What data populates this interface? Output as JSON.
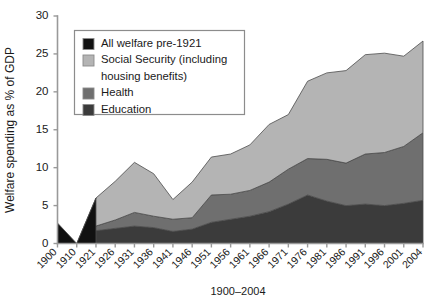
{
  "chart_data": {
    "type": "area",
    "stacked": true,
    "title": "",
    "xlabel": "1900–2004",
    "ylabel": "Welfare spending as % of GDP",
    "ylim": [
      0,
      30
    ],
    "yticks": [
      0,
      5,
      10,
      15,
      20,
      25,
      30
    ],
    "grid": false,
    "legend_position": "top-left",
    "categories": [
      "1900",
      "1910",
      "1921",
      "1926",
      "1931",
      "1936",
      "1941",
      "1946",
      "1951",
      "1956",
      "1961",
      "1966",
      "1971",
      "1976",
      "1981",
      "1986",
      "1991",
      "1996",
      "2001",
      "2004"
    ],
    "series": [
      {
        "name": "All welfare pre-1921",
        "color": "#111111",
        "values": [
          2.7,
          0.0,
          6.0,
          null,
          null,
          null,
          null,
          null,
          null,
          null,
          null,
          null,
          null,
          null,
          null,
          null,
          null,
          null,
          null,
          null
        ]
      },
      {
        "name": "Education",
        "color": "#3b3b3b",
        "values": [
          null,
          0.0,
          1.7,
          2.0,
          2.3,
          2.1,
          1.6,
          1.9,
          2.8,
          3.2,
          3.6,
          4.2,
          5.2,
          6.4,
          5.6,
          5.0,
          5.2,
          5.0,
          5.3,
          5.7
        ]
      },
      {
        "name": "Health",
        "color": "#6f6f6f",
        "values": [
          null,
          0.0,
          0.6,
          1.1,
          1.8,
          1.5,
          1.6,
          1.5,
          3.6,
          3.3,
          3.4,
          3.9,
          4.6,
          4.8,
          5.5,
          5.6,
          6.6,
          7.0,
          7.5,
          8.9
        ]
      },
      {
        "name": "Social Security (including housing benefits)",
        "color": "#b4b4b4",
        "values": [
          null,
          0.0,
          3.7,
          5.1,
          6.6,
          5.6,
          2.6,
          4.7,
          5.0,
          5.3,
          6.0,
          7.6,
          7.2,
          10.2,
          11.4,
          12.2,
          13.1,
          13.1,
          11.9,
          12.1
        ]
      }
    ],
    "totals": [
      2.7,
      0.0,
      12.0,
      8.2,
      10.7,
      9.2,
      5.8,
      8.1,
      11.4,
      11.8,
      13.0,
      15.7,
      17.0,
      21.4,
      22.5,
      22.8,
      24.9,
      25.1,
      24.7,
      26.7
    ]
  },
  "legend": {
    "items": [
      {
        "label": "All welfare pre-1921",
        "color": "#111111"
      },
      {
        "label": "Social Security (including",
        "color": "#b4b4b4"
      },
      {
        "label": "housing benefits)",
        "color": null
      },
      {
        "label": "Health",
        "color": "#6f6f6f"
      },
      {
        "label": "Education",
        "color": "#3b3b3b"
      }
    ]
  },
  "axes": {
    "y_title": "Welfare spending as % of GDP",
    "x_title": "1900–2004",
    "y_tick_labels": [
      "0",
      "5",
      "10",
      "15",
      "20",
      "25",
      "30"
    ],
    "x_tick_labels": [
      "1900",
      "1910",
      "1921",
      "1926",
      "1931",
      "1936",
      "1941",
      "1946",
      "1951",
      "1956",
      "1961",
      "1966",
      "1971",
      "1976",
      "1981",
      "1986",
      "1991",
      "1996",
      "2001",
      "2004"
    ]
  }
}
